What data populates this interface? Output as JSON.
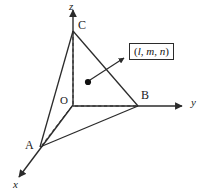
{
  "figure": {
    "kind": "3d-coordinate-diagram",
    "background_color": "#ffffff",
    "line_color": "#2b2b2b",
    "text_color": "#1a1a1a",
    "width": 206,
    "height": 193
  },
  "axes": [
    {
      "name": "z",
      "label": "z",
      "direction": "up",
      "label_x": 69,
      "label_y": 2
    },
    {
      "name": "y",
      "label": "y",
      "direction": "right",
      "label_x": 190,
      "label_y": 98
    },
    {
      "name": "x",
      "label": "x",
      "direction": "down-left",
      "label_x": 13,
      "label_y": 180
    }
  ],
  "origin": {
    "label": "O",
    "label_x": 60,
    "label_y": 96,
    "point_x": 73,
    "point_y": 105
  },
  "vertices": [
    {
      "name": "A",
      "label": "A",
      "point_x": 40,
      "point_y": 147,
      "label_x": 26,
      "label_y": 140
    },
    {
      "name": "B",
      "label": "B",
      "point_x": 138,
      "point_y": 106,
      "label_x": 141,
      "label_y": 90
    },
    {
      "name": "C",
      "label": "C",
      "point_x": 73,
      "point_y": 30,
      "label_x": 78,
      "label_y": 20
    }
  ],
  "normal_point": {
    "name": "normal-foot-point",
    "point_x": 88,
    "point_y": 82
  },
  "callout": {
    "text_open": "(",
    "text_l": "l",
    "sep1": ", ",
    "text_m": "m",
    "sep2": ", ",
    "text_n": "n",
    "text_close": ")",
    "full_text": "(l, m, n)",
    "box_x": 129,
    "box_y": 43,
    "box_w": 59,
    "box_h": 21
  },
  "arrow": {
    "name": "callout-leader-arrow",
    "from_x": 90,
    "from_y": 80,
    "to_x": 126,
    "to_y": 57
  },
  "edges": [
    {
      "name": "edge-AC",
      "style": "solid",
      "x1": 40,
      "y1": 147,
      "x2": 73,
      "y2": 30
    },
    {
      "name": "edge-CB",
      "style": "solid",
      "x1": 73,
      "y1": 30,
      "x2": 138,
      "y2": 106
    },
    {
      "name": "edge-AB",
      "style": "solid",
      "x1": 40,
      "y1": 147,
      "x2": 138,
      "y2": 106
    },
    {
      "name": "edge-OC",
      "style": "dashed",
      "x1": 73,
      "y1": 104,
      "x2": 73,
      "y2": 31
    },
    {
      "name": "edge-OB",
      "style": "dashed",
      "x1": 74,
      "y1": 106,
      "x2": 137,
      "y2": 106
    },
    {
      "name": "edge-OA",
      "style": "dashed",
      "x1": 73,
      "y1": 105,
      "x2": 41,
      "y2": 146
    }
  ]
}
